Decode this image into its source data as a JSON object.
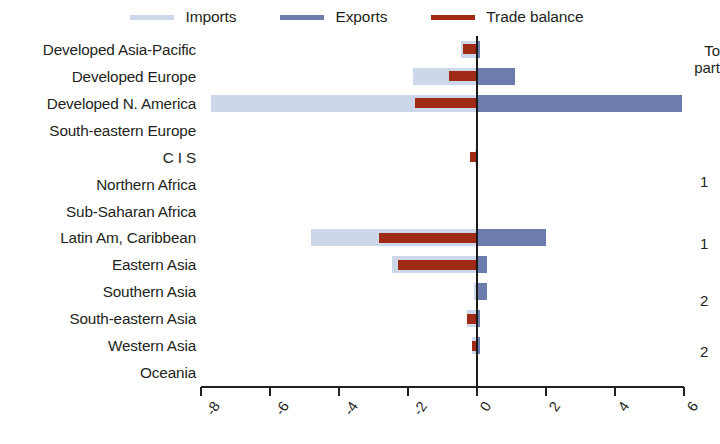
{
  "legend": {
    "items": [
      {
        "label": "Imports",
        "color": "#ccd8e9",
        "icon": "line-swatch-icon"
      },
      {
        "label": "Exports",
        "color": "#6c7cac",
        "icon": "line-swatch-icon"
      },
      {
        "label": "Trade balance",
        "color": "#a02a16",
        "icon": "line-swatch-icon"
      }
    ]
  },
  "side_note": {
    "line1": "To",
    "line2": "part",
    "numbers": [
      "1",
      "1",
      "2",
      "2"
    ]
  },
  "chart_data": {
    "type": "bar",
    "orientation": "horizontal",
    "title": "",
    "xlabel": "",
    "ylabel": "",
    "xlim": [
      -8,
      6
    ],
    "xticks": [
      -8,
      -6,
      -4,
      -2,
      0,
      2,
      4,
      6
    ],
    "xtick_labels": [
      "-8",
      "-6",
      "-4",
      "-2",
      "0",
      "2",
      "4",
      "6"
    ],
    "grid": false,
    "legend_position": "top",
    "categories": [
      "Developed Asia-Pacific",
      "Developed Europe",
      "Developed N. America",
      "South-eastern Europe",
      "C I S",
      "Northern Africa",
      "Sub-Saharan Africa",
      "Latin Am, Caribbean",
      "Eastern Asia",
      "Southern Asia",
      "South-eastern Asia",
      "Western Asia",
      "Oceania"
    ],
    "series": [
      {
        "name": "Imports",
        "color": "#ccd8e9",
        "values": [
          -0.45,
          -1.85,
          -7.7,
          0,
          -0.05,
          0,
          0,
          -4.8,
          -2.45,
          -0.1,
          -0.3,
          -0.15,
          0
        ]
      },
      {
        "name": "Exports",
        "color": "#6c7cac",
        "values": [
          0.05,
          1.1,
          5.95,
          0,
          0,
          0,
          0,
          2.0,
          0.3,
          0.3,
          0.05,
          0.05,
          0
        ]
      },
      {
        "name": "Trade balance",
        "color": "#a02a16",
        "values": [
          -0.4,
          -0.8,
          -1.8,
          0,
          -0.2,
          0,
          0,
          -2.85,
          -2.3,
          0,
          -0.3,
          -0.15,
          0
        ]
      }
    ]
  }
}
